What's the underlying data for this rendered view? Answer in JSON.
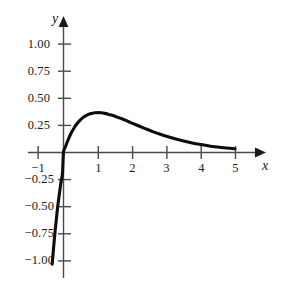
{
  "chart_data": {
    "type": "line",
    "title": "",
    "subtitle": "",
    "xlabel": "x",
    "ylabel": "y",
    "xlim": [
      -1.45,
      5.75
    ],
    "ylim": [
      -1.18,
      1.2
    ],
    "grid": false,
    "legend": null,
    "annotations": [],
    "x_ticks": [
      {
        "value": -1,
        "label": "−1"
      },
      {
        "value": 1,
        "label": "1"
      },
      {
        "value": 2,
        "label": "2"
      },
      {
        "value": 3,
        "label": "3"
      },
      {
        "value": 4,
        "label": "4"
      },
      {
        "value": 5,
        "label": "5"
      }
    ],
    "y_ticks": [
      {
        "value": 1.0,
        "label": "1.00"
      },
      {
        "value": 0.75,
        "label": "0.75"
      },
      {
        "value": 0.5,
        "label": "0.50"
      },
      {
        "value": 0.25,
        "label": "0.25"
      },
      {
        "value": -0.25,
        "label": "−0.25"
      },
      {
        "value": -0.5,
        "label": "−0.50"
      },
      {
        "value": -0.75,
        "label": "−0.75"
      },
      {
        "value": -1.0,
        "label": "−1.00"
      }
    ],
    "series": [
      {
        "name": "curve",
        "color": "#0d0d0d",
        "points": [
          [
            -0.33,
            -1.03
          ],
          [
            -0.3,
            -0.92
          ],
          [
            -0.27,
            -0.81
          ],
          [
            -0.24,
            -0.71
          ],
          [
            -0.21,
            -0.62
          ],
          [
            -0.18,
            -0.53
          ],
          [
            -0.15,
            -0.45
          ],
          [
            -0.12,
            -0.38
          ],
          [
            -0.09,
            -0.31
          ],
          [
            -0.06,
            -0.25
          ],
          [
            -0.03,
            -0.19
          ],
          [
            0.0,
            0.0
          ],
          [
            0.05,
            0.048
          ],
          [
            0.1,
            0.09
          ],
          [
            0.15,
            0.129
          ],
          [
            0.2,
            0.164
          ],
          [
            0.25,
            0.195
          ],
          [
            0.3,
            0.222
          ],
          [
            0.35,
            0.247
          ],
          [
            0.4,
            0.268
          ],
          [
            0.45,
            0.287
          ],
          [
            0.5,
            0.303
          ],
          [
            0.55,
            0.317
          ],
          [
            0.6,
            0.329
          ],
          [
            0.65,
            0.339
          ],
          [
            0.7,
            0.348
          ],
          [
            0.75,
            0.354
          ],
          [
            0.8,
            0.359
          ],
          [
            0.85,
            0.363
          ],
          [
            0.9,
            0.366
          ],
          [
            0.95,
            0.367
          ],
          [
            1.0,
            0.368
          ],
          [
            1.1,
            0.366
          ],
          [
            1.2,
            0.361
          ],
          [
            1.3,
            0.354
          ],
          [
            1.4,
            0.345
          ],
          [
            1.5,
            0.335
          ],
          [
            1.6,
            0.323
          ],
          [
            1.7,
            0.311
          ],
          [
            1.8,
            0.298
          ],
          [
            1.9,
            0.284
          ],
          [
            2.0,
            0.271
          ],
          [
            2.2,
            0.244
          ],
          [
            2.4,
            0.218
          ],
          [
            2.6,
            0.193
          ],
          [
            2.8,
            0.17
          ],
          [
            3.0,
            0.149
          ],
          [
            3.25,
            0.126
          ],
          [
            3.5,
            0.106
          ],
          [
            3.75,
            0.088
          ],
          [
            4.0,
            0.073
          ],
          [
            4.25,
            0.06
          ],
          [
            4.5,
            0.05
          ],
          [
            4.75,
            0.041
          ],
          [
            5.0,
            0.034
          ]
        ]
      }
    ]
  },
  "axes": {
    "x_axis_name": "x",
    "y_axis_name": "y"
  }
}
